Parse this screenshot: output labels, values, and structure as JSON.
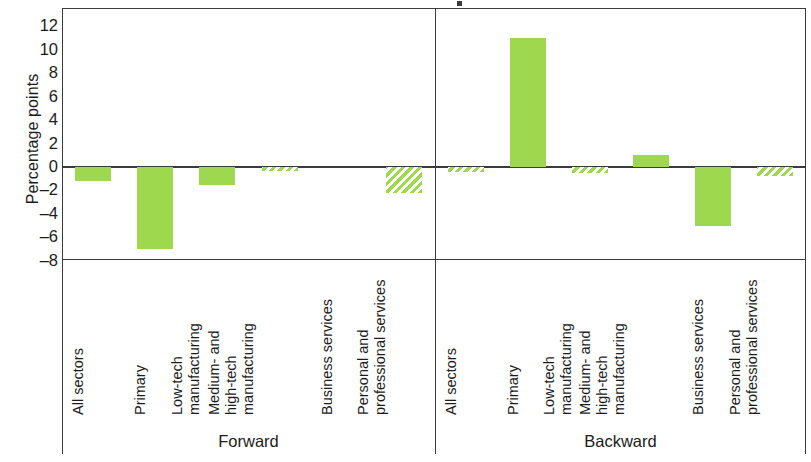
{
  "chart_data": {
    "type": "bar",
    "title": "",
    "xlabel": "",
    "ylabel": "Percentage points",
    "ylim": [
      -8,
      12
    ],
    "yticks": [
      12,
      10,
      8,
      6,
      4,
      2,
      0,
      -2,
      -4,
      -6,
      -8
    ],
    "ytick_labels": [
      "12",
      "10",
      "8",
      "6",
      "4",
      "2",
      "0",
      "–2",
      "–4",
      "–6",
      "–8"
    ],
    "grid": false,
    "legend": [],
    "accent_color": "#9ed84e",
    "axis_color": "#3b3b3b",
    "panels": [
      {
        "name": "Forward",
        "label": "Forward",
        "categories": [
          "All sectors",
          "Primary",
          "Low-tech manufacturing",
          "Medium- and high-tech manufacturing",
          "Business services",
          "Personal and professional services"
        ],
        "category_lines": [
          [
            "All sectors",
            ""
          ],
          [
            "Primary",
            ""
          ],
          [
            "Low-tech",
            "manufacturing"
          ],
          [
            "Medium- and",
            "high-tech",
            "manufacturing"
          ],
          [
            "Business services",
            ""
          ],
          [
            "Personal and",
            "professional services"
          ]
        ],
        "values": [
          -1.2,
          -7.0,
          -1.5,
          -0.3,
          0.0,
          -2.2
        ],
        "styles": [
          "solid",
          "solid",
          "solid",
          "hatched",
          "none",
          "hatched"
        ]
      },
      {
        "name": "Backward",
        "label": "Backward",
        "categories": [
          "All sectors",
          "Primary",
          "Low-tech manufacturing",
          "Medium- and high-tech manufacturing",
          "Business services",
          "Personal and professional services"
        ],
        "category_lines": [
          [
            "All sectors",
            ""
          ],
          [
            "Primary",
            ""
          ],
          [
            "Low-tech",
            "manufacturing"
          ],
          [
            "Medium- and",
            "high-tech",
            "manufacturing"
          ],
          [
            "Business services",
            ""
          ],
          [
            "Personal and",
            "professional services"
          ]
        ],
        "values": [
          -0.4,
          11.0,
          -0.5,
          1.0,
          -5.0,
          -0.8
        ],
        "styles": [
          "hatched",
          "solid",
          "hatched",
          "solid",
          "solid",
          "hatched"
        ]
      }
    ]
  }
}
